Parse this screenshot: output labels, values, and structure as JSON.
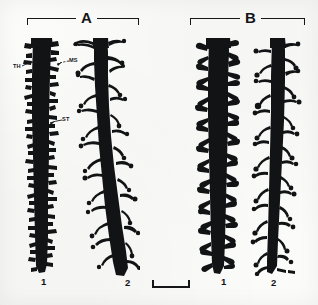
{
  "figure": {
    "background_color": "#fbfbfa",
    "ink_color": "#111214",
    "panels": [
      {
        "letter": "A",
        "bracket": {
          "x": 27,
          "y": 18,
          "width": 112
        },
        "letter_pos": {
          "x": 76,
          "y": 11
        },
        "specimens": [
          {
            "number": "1",
            "label_pos": {
              "x": 41,
              "y": 278
            },
            "spine_type": "short stubby, dense"
          },
          {
            "number": "2",
            "label_pos": {
              "x": 125,
              "y": 279
            },
            "spine_type": "long thin filopodial, bulbous tips"
          }
        ]
      },
      {
        "letter": "B",
        "bracket": {
          "x": 190,
          "y": 18,
          "width": 115
        },
        "letter_pos": {
          "x": 241,
          "y": 11
        },
        "specimens": [
          {
            "number": "1",
            "label_pos": {
              "x": 221,
              "y": 278
            },
            "spine_type": "medium mushroom, dense"
          },
          {
            "number": "2",
            "label_pos": {
              "x": 271,
              "y": 279
            },
            "spine_type": "long thin, bulbous heads"
          }
        ]
      }
    ],
    "annotations": [
      {
        "text": "TH",
        "x": 13,
        "y": 66,
        "leader_to": {
          "x": 33,
          "y": 62
        },
        "meaning": "thin spine"
      },
      {
        "text": "MS",
        "x": 69,
        "y": 60,
        "leader_to": {
          "x": 57,
          "y": 63
        },
        "meaning": "mushroom spine"
      },
      {
        "text": "ST",
        "x": 62,
        "y": 119,
        "leader_to": {
          "x": 50,
          "y": 122
        },
        "meaning": "stubby spine"
      }
    ],
    "scale_bar": {
      "x": 152,
      "y": 280,
      "width": 38,
      "height": 8
    }
  }
}
